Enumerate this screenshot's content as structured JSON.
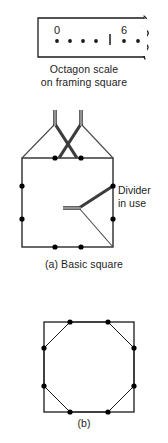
{
  "figure": {
    "type": "technical-line-diagram"
  },
  "scale_detail": {
    "caption_line1": "Octagon scale",
    "caption_line2": "on framing square",
    "tick_labels": [
      "0",
      "6"
    ],
    "dot_count_left_group": 4,
    "dot_count_right_group": 2,
    "has_tick_divider": true,
    "has_broken_edge": true,
    "edge_break_style": "wavy"
  },
  "panel_a": {
    "caption": "(a)  Basic square",
    "annotation_line1": "Divider",
    "annotation_line2": "in use",
    "point_count": 8,
    "divider_count": 3
  },
  "panel_b": {
    "caption": "(b)",
    "point_count": 8,
    "shape": "octagon inscribed in square"
  },
  "colors": {
    "line": "#1a1a1a",
    "point": "#000000",
    "tool": "#3c3c3c",
    "background": "#ffffff"
  }
}
